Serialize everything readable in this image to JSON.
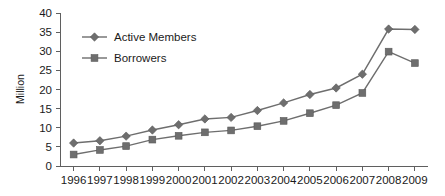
{
  "chart_data": {
    "type": "line",
    "title": "",
    "xlabel": "",
    "ylabel": "Million",
    "categories": [
      "1996",
      "1997",
      "1998",
      "1999",
      "2000",
      "2001",
      "2002",
      "2003",
      "2004",
      "2005",
      "2006",
      "2007",
      "2008",
      "2009"
    ],
    "ylim": [
      0,
      40
    ],
    "yticks": [
      0,
      5,
      10,
      15,
      20,
      25,
      30,
      35,
      40
    ],
    "grid": false,
    "legend_position": "upper-left-inside",
    "series": [
      {
        "name": "Active Members",
        "marker": "diamond",
        "color": "#6e6e6e",
        "values": [
          6.0,
          6.6,
          7.8,
          9.4,
          10.8,
          12.3,
          12.7,
          14.5,
          16.5,
          18.7,
          20.4,
          24.0,
          35.8,
          35.7
        ]
      },
      {
        "name": "Borrowers",
        "marker": "square",
        "color": "#6e6e6e",
        "values": [
          3.0,
          4.2,
          5.2,
          6.9,
          7.9,
          8.8,
          9.3,
          10.4,
          11.8,
          13.8,
          15.9,
          19.1,
          29.9,
          26.9
        ]
      }
    ]
  },
  "legend": {
    "items": [
      {
        "label": "Active Members",
        "marker": "diamond"
      },
      {
        "label": "Borrowers",
        "marker": "square"
      }
    ]
  },
  "axis": {
    "y_title": "Million",
    "y_labels": [
      "40",
      "35",
      "30",
      "25",
      "20",
      "15",
      "10",
      "5",
      "0"
    ],
    "x_labels": [
      "1996",
      "1997",
      "1998",
      "1999",
      "2000",
      "2001",
      "2002",
      "2003",
      "2004",
      "2005",
      "2006",
      "2007",
      "2008",
      "2009"
    ]
  },
  "colors": {
    "series": "#6e6e6e",
    "axis": "#5f5f5f",
    "text": "#1a1a1a",
    "background": "#ffffff"
  }
}
